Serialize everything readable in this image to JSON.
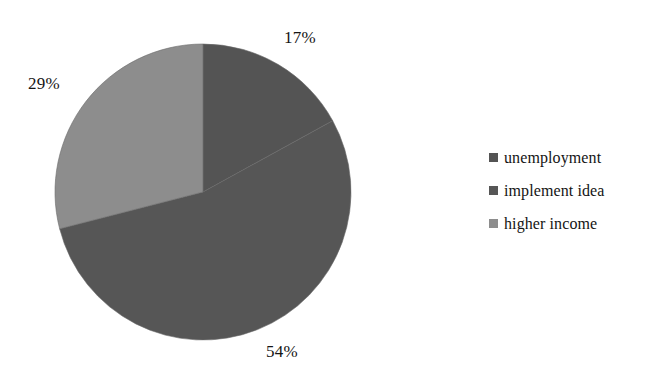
{
  "chart_data": {
    "type": "pie",
    "title": "",
    "subtitle": "",
    "xlabel": "",
    "ylabel": "",
    "grid": false,
    "legend_position": "right",
    "start_angle_deg": 0,
    "direction": "clockwise",
    "categories": [
      "unemployment",
      "implement idea",
      "higher income"
    ],
    "values": [
      17,
      54,
      29
    ],
    "value_unit": "%",
    "data_labels": [
      "17%",
      "54%",
      "29%"
    ],
    "slice_colors": [
      "#545454",
      "#565656",
      "#8d8d8d"
    ],
    "annotations": []
  },
  "labels": {
    "unemployment_pct": "17%",
    "implement_idea_pct": "54%",
    "higher_income_pct": "29%"
  },
  "legend": {
    "items": [
      {
        "label": "unemployment",
        "color": "#545454",
        "value": "17%"
      },
      {
        "label": "implement idea",
        "color": "#565656",
        "value": "54%"
      },
      {
        "label": "higher income",
        "color": "#8d8d8d",
        "value": "29%"
      }
    ]
  },
  "colors": {
    "background": "#ffffff",
    "text": "#141414",
    "slice_dark_1": "#545454",
    "slice_dark_2": "#565656",
    "slice_light": "#8d8d8d",
    "slice_divider": "#6a6a6a"
  },
  "geometry": {
    "center_x": 203,
    "center_y": 192,
    "radius": 148
  }
}
